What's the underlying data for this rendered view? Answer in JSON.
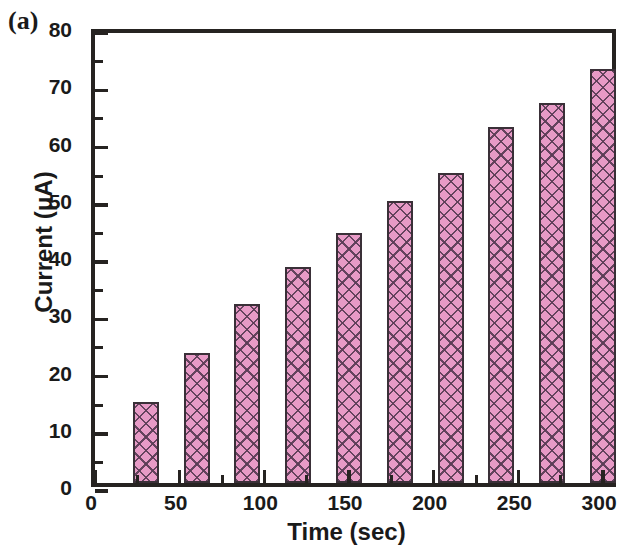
{
  "panel": {
    "label": "(a)"
  },
  "chart_data": {
    "type": "bar",
    "title": "",
    "xlabel": "Time (sec)",
    "ylabel": "Current (μA)",
    "xlim": [
      0,
      310
    ],
    "ylim": [
      0,
      80
    ],
    "grid": false,
    "legend": null,
    "bar_color": "#e79ac6",
    "bar_edge_color": "#3a3038",
    "bar_hatch": "crosshatch",
    "axis_color": "#262321",
    "x": [
      30,
      60,
      90,
      120,
      150,
      180,
      210,
      240,
      270,
      300
    ],
    "categories": [
      "30",
      "60",
      "90",
      "120",
      "150",
      "180",
      "210",
      "240",
      "270",
      "300"
    ],
    "values": [
      14.1,
      22.7,
      31.2,
      37.7,
      43.7,
      49.2,
      54.1,
      62.1,
      66.4,
      72.4
    ],
    "bar_width": 26,
    "xticks_major": [
      0,
      50,
      100,
      150,
      200,
      250,
      300
    ],
    "xticks_major_labels": [
      "0",
      "50",
      "100",
      "150",
      "200",
      "250",
      "300"
    ],
    "xticks_minor": [
      25,
      75,
      125,
      175,
      225,
      275
    ],
    "yticks_major": [
      0,
      10,
      20,
      30,
      40,
      50,
      60,
      70,
      80
    ],
    "yticks_major_labels": [
      "0",
      "10",
      "20",
      "30",
      "40",
      "50",
      "60",
      "70",
      "80"
    ],
    "yticks_minor": [
      5,
      15,
      25,
      35,
      45,
      55,
      65,
      75
    ]
  }
}
